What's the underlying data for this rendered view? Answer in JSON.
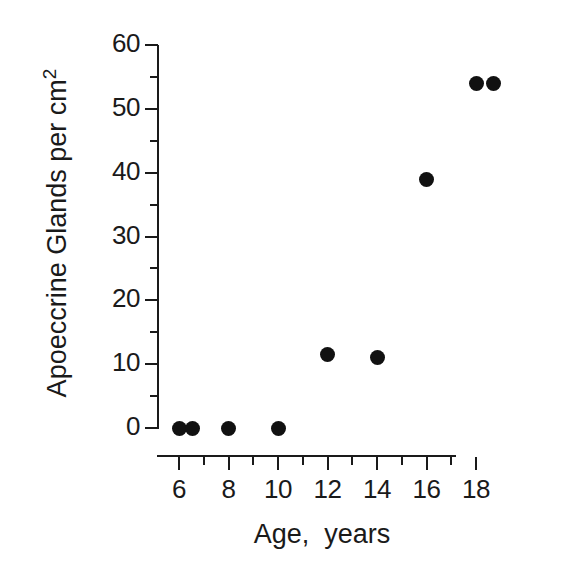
{
  "chart_data": {
    "type": "scatter",
    "title": "",
    "xlabel": "Age,  years",
    "ylabel": "Apoeccrine Glands per cm",
    "ylabel_superscript": "2",
    "xlim": [
      5.1,
      19.2
    ],
    "ylim": [
      0,
      60
    ],
    "grid": false,
    "legend": null,
    "x_ticks_major": [
      6,
      8,
      10,
      12,
      14,
      16,
      18
    ],
    "x_tick_labels": [
      "6",
      "8",
      "10",
      "12",
      "14",
      "16",
      "18"
    ],
    "x_ticks_minor": [
      7,
      9,
      11,
      13,
      15,
      17,
      19
    ],
    "y_ticks_major": [
      0,
      10,
      20,
      30,
      40,
      50,
      60
    ],
    "y_tick_labels": [
      "0",
      "10",
      "20",
      "30",
      "40",
      "50",
      "60"
    ],
    "y_ticks_minor": [
      5,
      15,
      25,
      35,
      45,
      55
    ],
    "points": [
      {
        "x": 6.0,
        "y": 0
      },
      {
        "x": 6.55,
        "y": 0
      },
      {
        "x": 8.0,
        "y": 0
      },
      {
        "x": 10.0,
        "y": 0
      },
      {
        "x": 12.0,
        "y": 11.5
      },
      {
        "x": 14.0,
        "y": 11
      },
      {
        "x": 16.0,
        "y": 39
      },
      {
        "x": 18.0,
        "y": 54
      },
      {
        "x": 18.7,
        "y": 54
      }
    ],
    "marker": "filled-circle",
    "marker_color": "#111111",
    "axis_color": "#1a1a1a",
    "background_color": "#ffffff"
  }
}
